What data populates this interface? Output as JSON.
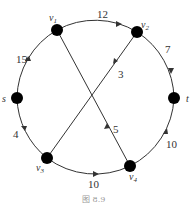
{
  "nodes": [
    {
      "id": "v1",
      "label": "v",
      "sub": "1",
      "x": 57,
      "y": 30
    },
    {
      "id": "v2",
      "label": "v",
      "sub": "2",
      "x": 137,
      "y": 32
    },
    {
      "id": "s",
      "label": "s",
      "sub": "",
      "x": 17,
      "y": 98
    },
    {
      "id": "t",
      "label": "t",
      "sub": "",
      "x": 174,
      "y": 98
    },
    {
      "id": "v3",
      "label": "v",
      "sub": "3",
      "x": 47,
      "y": 158
    },
    {
      "id": "v4",
      "label": "v",
      "sub": "4",
      "x": 130,
      "y": 166
    }
  ],
  "edges": [
    {
      "from": "s",
      "to": "v1",
      "weight": "15"
    },
    {
      "from": "v1",
      "to": "v2",
      "weight": "12"
    },
    {
      "from": "v2",
      "to": "t",
      "weight": "7"
    },
    {
      "from": "v2",
      "to": "v3",
      "weight": "3"
    },
    {
      "from": "s",
      "to": "v3",
      "weight": "4"
    },
    {
      "from": "v3",
      "to": "v4",
      "weight": "10"
    },
    {
      "from": "v4",
      "to": "v1",
      "weight": "5"
    },
    {
      "from": "v4",
      "to": "t",
      "weight": "10"
    }
  ],
  "labels": {
    "v1": "v",
    "v1_sub": "1",
    "v2": "v",
    "v2_sub": "2",
    "v3": "v",
    "v3_sub": "3",
    "v4": "v",
    "v4_sub": "4",
    "s": "s",
    "t": "t",
    "w_s_v1": "15",
    "w_v1_v2": "12",
    "w_v2_t": "7",
    "w_v2_v3": "3",
    "w_s_v3": "4",
    "w_v3_v4": "10",
    "w_v4_v1": "5",
    "w_v4_t": "10"
  },
  "caption": "图 8.9"
}
